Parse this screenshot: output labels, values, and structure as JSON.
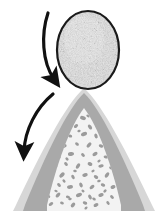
{
  "figure": {
    "canvas": {
      "width": 160,
      "height": 221,
      "background": "#ffffff"
    },
    "elements": {
      "egg": {
        "label": "Stippled ovoid egg",
        "center_x": 88,
        "center_y": 50,
        "radius_x": 31,
        "radius_y": 39,
        "fill": "#c9c9c9",
        "texture": "stipple",
        "outline_color": "#1a1a1a",
        "outline_width": 2.2
      },
      "mound": {
        "label": "Layered conical mound",
        "apex_x": 84,
        "apex_y": 88,
        "base_y": 211,
        "left_base_x": 8,
        "right_base_x": 152,
        "layers": [
          {
            "name": "outer-pale-band",
            "fill": "#d7d7d7"
          },
          {
            "name": "mid-gray-band",
            "fill": "#a9a9a9"
          },
          {
            "name": "inner-core",
            "fill": "#f3f3f3"
          }
        ]
      },
      "core_speckles": {
        "label": "Gray cellular blobs inside core",
        "fill": "#9b9b9b",
        "count": 62
      },
      "arrow_top": {
        "label": "Upper curved arrow descending toward the egg base",
        "start_x": 48,
        "start_y": 13,
        "end_x": 57,
        "end_y": 84,
        "color": "#111111",
        "stroke_width": 3.2,
        "direction": "down-right"
      },
      "arrow_bottom": {
        "label": "Lower curved arrow sweeping down the mound flank",
        "start_x": 53,
        "start_y": 94,
        "end_x": 23,
        "end_y": 158,
        "color": "#111111",
        "stroke_width": 3.2,
        "direction": "down-left"
      }
    }
  }
}
